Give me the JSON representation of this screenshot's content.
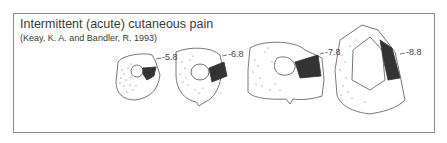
{
  "figure": {
    "title": "Intermittent (acute) cutaneous pain",
    "citation": "(Keay, K. A. and Bandler, R. 1993)",
    "sections": [
      {
        "level": "-5.8"
      },
      {
        "level": "-6.8"
      },
      {
        "level": "-7.8"
      },
      {
        "level": "-8.8"
      }
    ],
    "colors": {
      "outline": "#555555",
      "shading": "#333333",
      "frame": "#8a8a8a",
      "text": "#3a3a3a"
    }
  }
}
